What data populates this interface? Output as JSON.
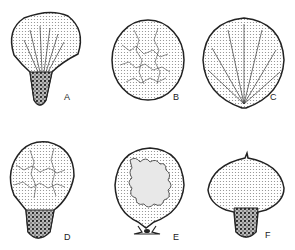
{
  "figure": {
    "panels": [
      {
        "id": "A",
        "label": "A",
        "description": "pear-shaped fruiting body with radiating fibrous capillitium and dark granular base"
      },
      {
        "id": "B",
        "label": "B",
        "description": "round body with reticulate capillitium"
      },
      {
        "id": "C",
        "label": "C",
        "description": "round body with radiating branched threads converging at base"
      },
      {
        "id": "D",
        "label": "D",
        "description": "pear-shaped body with reticulate network and dark granular base"
      },
      {
        "id": "E",
        "label": "E",
        "description": "globose body with sinuous lobed mass on short stalk"
      },
      {
        "id": "F",
        "label": "F",
        "description": "pear-shaped body with stippled upper chamber and dark granular base"
      }
    ],
    "colors": {
      "ink": "#222222",
      "stipple": "#d8d8d8",
      "dark": "#555555"
    }
  }
}
